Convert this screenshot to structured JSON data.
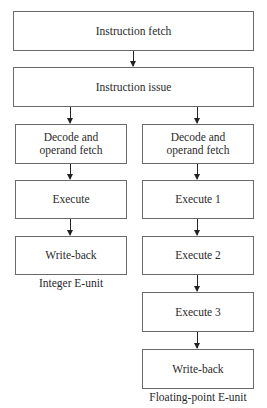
{
  "diagram": {
    "top": {
      "fetch": "Instruction fetch",
      "issue": "Instruction issue"
    },
    "integer_unit": {
      "caption": "Integer E-unit",
      "stages": [
        "Decode and",
        "operand fetch",
        "Execute",
        "Write-back"
      ]
    },
    "float_unit": {
      "caption": "Floating-point E-unit",
      "stages": [
        "Decode and",
        "operand fetch",
        "Execute 1",
        "Execute 2",
        "Execute 3",
        "Write-back"
      ]
    }
  }
}
